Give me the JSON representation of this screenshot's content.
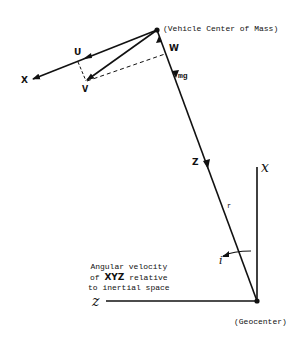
{
  "labels": {
    "vehicle_center": "(Vehicle Center of Mass)",
    "geocenter": "(Geocenter)",
    "X": "X",
    "U": "U",
    "V": "V",
    "W": "W",
    "mg": "mg",
    "Z": "Z",
    "r": "r",
    "i": "i",
    "x_inertial": "x",
    "z_inertial": "z"
  },
  "caption": {
    "line1": "Angular velocity",
    "line2_pre": "of ",
    "line2_bold": "XYZ",
    "line2_post": " relative",
    "line3": "to inertial space"
  },
  "colors": {
    "ink": "#111111",
    "background": "#ffffff"
  }
}
